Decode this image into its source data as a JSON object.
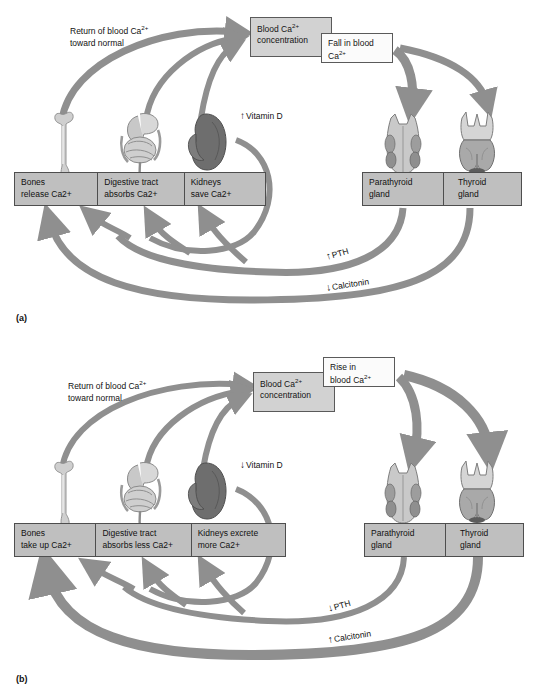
{
  "figure": {
    "type": "physiology-flow-diagram",
    "panels": [
      {
        "caption": "(a)",
        "trigger_box": {
          "line1": "Fall in blood",
          "line2": "Ca",
          "line2_sup": "2+"
        },
        "concentration_box": {
          "line1": "Blood Ca",
          "line1_sup": "2+",
          "line2": "concentration"
        },
        "feedback_text": {
          "line1": "Return of blood Ca",
          "line1_sup": "2+",
          "line2": "toward normal"
        },
        "vitamin_d": {
          "arrow": "up",
          "glyph": "↑",
          "label": "Vitamin D"
        },
        "effectors": [
          {
            "line1": "Bones",
            "line2": "release Ca",
            "line2_sup": "2+"
          },
          {
            "line1": "Digestive tract",
            "line2": "absorbs Ca",
            "line2_sup": "2+"
          },
          {
            "line1": "Kidneys",
            "line2": "save Ca",
            "line2_sup": "2+"
          }
        ],
        "glands": [
          {
            "line1": "Parathyroid",
            "line2": "gland"
          },
          {
            "line1": "Thyroid",
            "line2": "gland"
          }
        ],
        "hormones": [
          {
            "name": "PTH",
            "arrow": "up",
            "glyph": "↑"
          },
          {
            "name": "Calcitonin",
            "arrow": "down",
            "glyph": "↓"
          }
        ]
      },
      {
        "caption": "(b)",
        "trigger_box": {
          "line1": "Rise in",
          "line2": "blood Ca",
          "line2_sup": "2+"
        },
        "concentration_box": {
          "line1": "Blood Ca",
          "line1_sup": "2+",
          "line2": "concentration"
        },
        "feedback_text": {
          "line1": "Return of blood Ca",
          "line1_sup": "2+",
          "line2": "toward normal"
        },
        "vitamin_d": {
          "arrow": "down",
          "glyph": "↓",
          "label": "Vitamin D"
        },
        "effectors": [
          {
            "line1": "Bones",
            "line2": "take up Ca",
            "line2_sup": "2+"
          },
          {
            "line1": "Digestive tract",
            "line2": "absorbs less Ca",
            "line2_sup": "2+"
          },
          {
            "line1": "Kidneys excrete",
            "line2": "more Ca",
            "line2_sup": "2+"
          }
        ],
        "glands": [
          {
            "line1": "Parathyroid",
            "line2": "gland"
          },
          {
            "line1": "Thyroid",
            "line2": "gland"
          }
        ],
        "hormones": [
          {
            "name": "PTH",
            "arrow": "down",
            "glyph": "↓"
          },
          {
            "name": "Calcitonin",
            "arrow": "up",
            "glyph": "↑"
          }
        ]
      }
    ],
    "organ_art": [
      "bone-illustration",
      "digestive-tract-illustration",
      "kidney-illustration",
      "parathyroid-gland-illustration",
      "thyroid-gland-illustration"
    ],
    "colors": {
      "arrow_gray": "#8f8f8f",
      "box_gray": "#d2d2d2",
      "organ_box_gray": "#bfbfbf",
      "box_border": "#5a5a5a",
      "text": "#141414",
      "page_background": "#ffffff"
    }
  }
}
